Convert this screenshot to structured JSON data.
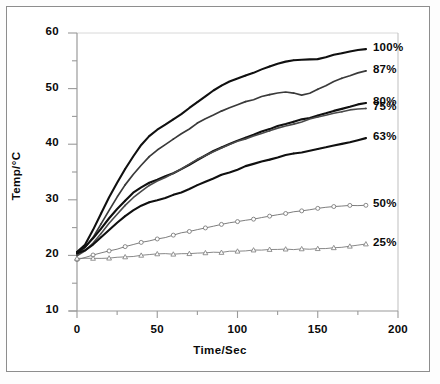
{
  "chart_data": {
    "type": "line",
    "title": "",
    "xlabel": "Time/Sec",
    "ylabel": "Temp/°C",
    "xlim": [
      0,
      200
    ],
    "ylim": [
      10,
      60
    ],
    "xticks": [
      0,
      50,
      100,
      150,
      200
    ],
    "xtick_labels": [
      "0",
      "50",
      "100",
      "150",
      "200"
    ],
    "xminor_step": 25,
    "yticks": [
      10,
      20,
      30,
      40,
      50,
      60
    ],
    "ytick_labels": [
      "10",
      "20",
      "30",
      "40",
      "50",
      "60"
    ],
    "yminor_step": 5,
    "grid": false,
    "legend_position": "right-inline-end-of-line",
    "x": [
      0,
      5,
      10,
      15,
      20,
      25,
      30,
      35,
      40,
      45,
      50,
      55,
      60,
      65,
      70,
      75,
      80,
      85,
      90,
      95,
      100,
      105,
      110,
      115,
      120,
      125,
      130,
      135,
      140,
      145,
      150,
      155,
      160,
      165,
      170,
      175,
      180
    ],
    "series": [
      {
        "name": "100%",
        "label": "100%",
        "marker": "small-dot",
        "color": "#101010",
        "width": 2.1,
        "values": [
          20.6,
          22.0,
          24.6,
          27.6,
          30.5,
          33.1,
          35.6,
          37.8,
          39.8,
          41.4,
          42.6,
          43.5,
          44.4,
          45.4,
          46.5,
          47.6,
          48.7,
          49.7,
          50.6,
          51.3,
          51.9,
          52.4,
          52.9,
          53.4,
          53.9,
          54.4,
          54.8,
          55.0,
          55.1,
          55.2,
          55.4,
          55.7,
          56.1,
          56.4,
          56.7,
          57.0,
          57.2
        ]
      },
      {
        "name": "87%",
        "label": "87%",
        "marker": "small-dot",
        "color": "#3a3a3a",
        "width": 1.7,
        "values": [
          20.3,
          21.3,
          23.2,
          25.6,
          28.1,
          30.4,
          32.6,
          34.6,
          36.3,
          37.8,
          39.0,
          40.0,
          41.0,
          41.9,
          42.8,
          43.7,
          44.5,
          45.2,
          45.9,
          46.5,
          47.1,
          47.6,
          48.1,
          48.6,
          49.0,
          49.3,
          49.4,
          49.2,
          48.9,
          49.2,
          49.8,
          50.5,
          51.2,
          51.8,
          52.3,
          52.8,
          53.1
        ]
      },
      {
        "name": "80%",
        "label": "80%",
        "marker": "small-dot",
        "color": "#101010",
        "width": 2.1,
        "values": [
          20.7,
          21.6,
          23.1,
          24.9,
          26.7,
          28.4,
          29.9,
          31.2,
          32.2,
          33.0,
          33.6,
          34.2,
          34.7,
          35.5,
          36.4,
          37.2,
          38.0,
          38.8,
          39.5,
          40.1,
          40.7,
          41.2,
          41.7,
          42.2,
          42.7,
          43.2,
          43.6,
          44.0,
          44.4,
          44.8,
          45.2,
          45.6,
          46.0,
          46.4,
          46.8,
          47.2,
          47.5
        ]
      },
      {
        "name": "75%",
        "label": "75%",
        "marker": "small-dot",
        "color": "#4a4a4a",
        "width": 1.6,
        "values": [
          19.9,
          20.8,
          22.2,
          23.9,
          25.7,
          27.4,
          29.0,
          30.4,
          31.6,
          32.6,
          33.4,
          34.1,
          34.8,
          35.6,
          36.4,
          37.2,
          37.9,
          38.6,
          39.3,
          39.9,
          40.5,
          41.0,
          41.5,
          42.0,
          42.5,
          42.9,
          43.3,
          43.7,
          44.1,
          44.5,
          44.9,
          45.2,
          45.5,
          45.8,
          46.1,
          46.3,
          46.5
        ]
      },
      {
        "name": "63%",
        "label": "63%",
        "marker": "small-dot",
        "color": "#101010",
        "width": 2.1,
        "values": [
          20.4,
          21.0,
          22.0,
          23.3,
          24.6,
          25.9,
          27.0,
          28.0,
          28.9,
          29.5,
          29.9,
          30.3,
          30.8,
          31.4,
          32.0,
          32.7,
          33.3,
          33.9,
          34.5,
          35.0,
          35.5,
          36.0,
          36.4,
          36.8,
          37.2,
          37.6,
          38.0,
          38.3,
          38.6,
          38.9,
          39.2,
          39.5,
          39.8,
          40.1,
          40.4,
          40.7,
          41.0
        ]
      },
      {
        "name": "50%",
        "label": "50%",
        "marker": "open-circle",
        "color": "#6e6e6e",
        "width": 0.9,
        "values": [
          19.2,
          19.6,
          20.0,
          20.4,
          20.8,
          21.2,
          21.6,
          22.0,
          22.4,
          22.7,
          23.0,
          23.3,
          23.7,
          24.0,
          24.3,
          24.6,
          24.9,
          25.2,
          25.5,
          25.8,
          26.1,
          26.4,
          26.6,
          26.9,
          27.1,
          27.4,
          27.6,
          27.8,
          28.0,
          28.2,
          28.4,
          28.6,
          28.7,
          28.8,
          28.9,
          29.0,
          29.1
        ]
      },
      {
        "name": "25%",
        "label": "25%",
        "marker": "open-triangle",
        "color": "#7a7a7a",
        "width": 0.9,
        "values": [
          19.5,
          19.5,
          19.5,
          19.5,
          19.6,
          19.6,
          19.7,
          19.8,
          20.0,
          20.1,
          20.2,
          20.3,
          20.3,
          20.4,
          20.4,
          20.5,
          20.5,
          20.6,
          20.6,
          20.7,
          20.7,
          20.8,
          20.9,
          20.9,
          21.0,
          21.0,
          21.1,
          21.1,
          21.2,
          21.2,
          21.3,
          21.3,
          21.4,
          21.5,
          21.6,
          21.8,
          22.0
        ]
      }
    ]
  },
  "labels": {
    "x_title": "Time/Sec",
    "y_title": "Temp/°C"
  },
  "colors": {
    "axis": "#9a9a9a",
    "text": "#0a0a0a",
    "frame": "#8d8d8d",
    "background": "#ffffff"
  }
}
